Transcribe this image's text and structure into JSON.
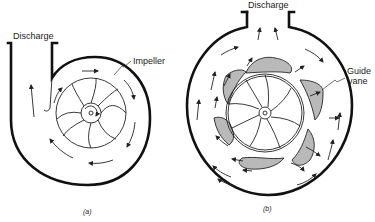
{
  "figure": {
    "panel_a": {
      "caption": "(a)",
      "labels": {
        "discharge": "Discharge",
        "impeller": "Impeller"
      },
      "type": "volute-casing centrifugal pump"
    },
    "panel_b": {
      "caption": "(b)",
      "labels": {
        "discharge": "Discharge",
        "guide_vane_line1": "Guide",
        "guide_vane_line2": "vane"
      },
      "type": "diffuser (guide-vane) centrifugal pump"
    },
    "colors": {
      "ink": "#111111",
      "vane_fill": "#b9b9b9",
      "background": "#ffffff"
    }
  }
}
